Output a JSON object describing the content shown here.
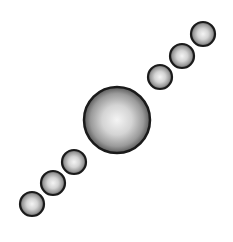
{
  "canvas": {
    "width": 233,
    "height": 242,
    "background": "#ffffff"
  },
  "colors": {
    "outline": "#1a1a1a",
    "highlight": "#f4f4f4",
    "mid": "#b8b8b8",
    "shadow": "#6a6a6a"
  },
  "spheres": [
    {
      "name": "small-sphere-lower-1",
      "cx": 32,
      "cy": 204,
      "r": 12
    },
    {
      "name": "small-sphere-lower-2",
      "cx": 53,
      "cy": 183,
      "r": 12
    },
    {
      "name": "small-sphere-lower-3",
      "cx": 74,
      "cy": 162,
      "r": 12
    },
    {
      "name": "large-sphere-center",
      "cx": 117,
      "cy": 120,
      "r": 33
    },
    {
      "name": "small-sphere-upper-1",
      "cx": 160,
      "cy": 77,
      "r": 12
    },
    {
      "name": "small-sphere-upper-2",
      "cx": 182,
      "cy": 56,
      "r": 12
    },
    {
      "name": "small-sphere-upper-3",
      "cx": 203,
      "cy": 34,
      "r": 12
    }
  ]
}
